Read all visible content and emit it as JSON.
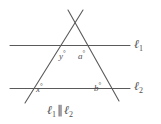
{
  "figure": {
    "kind": "geometry-diagram",
    "background_color": "#ffffff",
    "stroke_color": "#5a5a5a",
    "text_color": "#4f4f4f",
    "caption": {
      "line1": "ℓ",
      "line1_sub": "1",
      "parallel_symbol": "∥",
      "line2": "ℓ",
      "line2_sub": "2",
      "full_text": "ℓ₁ ∥ ℓ₂"
    },
    "lines": {
      "l1": {
        "label": "ℓ",
        "subscript": "1",
        "full_label": "ℓ₁"
      },
      "l2": {
        "label": "ℓ",
        "subscript": "2",
        "full_label": "ℓ₂"
      }
    },
    "angles": [
      {
        "id": "y",
        "variable": "y",
        "degree_symbol": "°",
        "full_label": "y°",
        "position": "below-l1-left"
      },
      {
        "id": "a",
        "variable": "a",
        "degree_symbol": "°",
        "full_label": "a°",
        "position": "below-l1-right"
      },
      {
        "id": "x",
        "variable": "x",
        "degree_symbol": "°",
        "full_label": "x°",
        "position": "above-l2-left"
      },
      {
        "id": "b",
        "variable": "b",
        "degree_symbol": "°",
        "full_label": "b°",
        "position": "above-l2-right"
      }
    ]
  }
}
